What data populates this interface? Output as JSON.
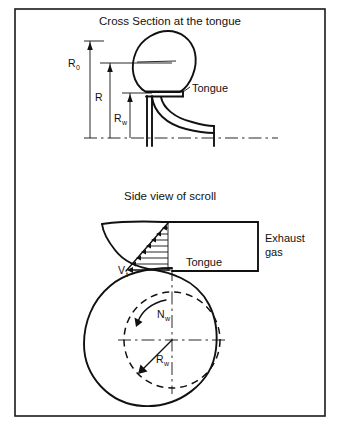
{
  "figure": {
    "background_color": "#ffffff",
    "ink_color": "#111111",
    "frame": {
      "x": 15,
      "y": 9,
      "width": 310,
      "height": 407
    }
  },
  "panels": [
    {
      "id": "cross-section",
      "title": "Cross Section at the tongue",
      "labels": [
        {
          "name": "R0",
          "base": "R",
          "sub": "0",
          "x": 70,
          "y": 64
        },
        {
          "name": "R",
          "base": "R",
          "sub": "",
          "x": 96,
          "y": 98
        },
        {
          "name": "Rw",
          "base": "R",
          "sub": "w",
          "x": 117,
          "y": 118
        },
        {
          "name": "Tongue",
          "base": "Tongue",
          "sub": "",
          "x": 191,
          "y": 89
        }
      ]
    },
    {
      "id": "side-view",
      "title": "Side view of scroll",
      "labels": [
        {
          "name": "Vt",
          "base": "V",
          "sub": "t",
          "x": 122,
          "y": 272
        },
        {
          "name": "Tongue",
          "base": "Tongue",
          "sub": "",
          "x": 188,
          "y": 269
        },
        {
          "name": "Nw",
          "base": "N",
          "sub": "w",
          "x": 160,
          "y": 314
        },
        {
          "name": "Rw",
          "base": "R",
          "sub": "w",
          "x": 160,
          "y": 359
        },
        {
          "name": "ExhaustGas",
          "base": "Exhaust",
          "sub": "",
          "x": 265,
          "y": 239
        }
      ],
      "exhaust_gas_lines": [
        "Exhaust",
        "gas"
      ]
    }
  ],
  "annotations": {
    "title_cross_section": "Cross Section at the tongue",
    "title_side_view": "Side view of scroll",
    "tongue_upper": "Tongue",
    "tongue_lower": "Tongue",
    "exhaust_line1": "Exhaust",
    "exhaust_line2": "gas",
    "r_outer_base": "R",
    "r_outer_sub": "0",
    "r_mid_base": "R",
    "r_mid_sub": "",
    "r_wheel_upper_base": "R",
    "r_wheel_upper_sub": "w",
    "v_tongue_base": "V",
    "v_tongue_sub": "t",
    "n_wheel_base": "N",
    "n_wheel_sub": "w",
    "r_wheel_lower_base": "R",
    "r_wheel_lower_sub": "w"
  },
  "geometry": {
    "velocity_profile_arrow_count": 8,
    "wheel_circle": {
      "cx": 172,
      "cy": 340,
      "r": 48,
      "style": "dashed"
    },
    "scroll_type": "volute-spiral"
  }
}
